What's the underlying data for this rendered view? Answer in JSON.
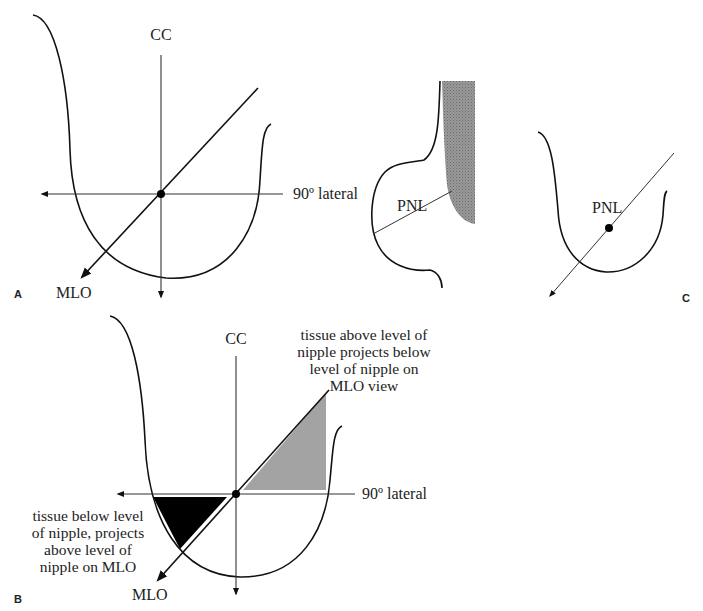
{
  "figure": {
    "panels": [
      {
        "id": "A",
        "label": "A",
        "axes": {
          "vertical": "CC",
          "horizontal": "90º lateral",
          "oblique": "MLO"
        }
      },
      {
        "id": "B",
        "label": "B",
        "axes": {
          "vertical": "CC",
          "horizontal": "90º lateral",
          "oblique": "MLO"
        },
        "annotations": {
          "above": [
            "tissue above level of",
            "nipple projects below",
            "level of nipple on",
            "MLO view"
          ],
          "below": [
            "tissue below level",
            "of nipple, projects",
            "above level of",
            "nipple on MLO"
          ]
        },
        "colors": {
          "above_region": "#a0a0a0",
          "below_region": "#000000"
        }
      },
      {
        "id": "middle",
        "label": "",
        "line_label": "PNL",
        "colors": {
          "chest_wall": "#8a8a8a"
        }
      },
      {
        "id": "C",
        "label": "C",
        "line_label": "PNL"
      }
    ]
  }
}
